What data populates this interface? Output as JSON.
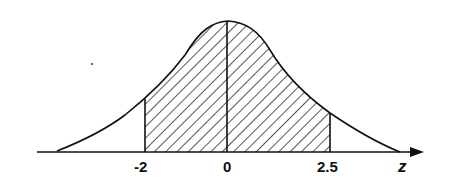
{
  "diagram": {
    "axis_label": "z",
    "tick_labels": {
      "left": "-2",
      "center": "0",
      "right": "2.5"
    },
    "shaded_region": {
      "from": -2,
      "to": 2.5,
      "pattern": "diagonal hatching"
    },
    "colors": {
      "line": "#111111",
      "background": "#ffffff"
    }
  }
}
